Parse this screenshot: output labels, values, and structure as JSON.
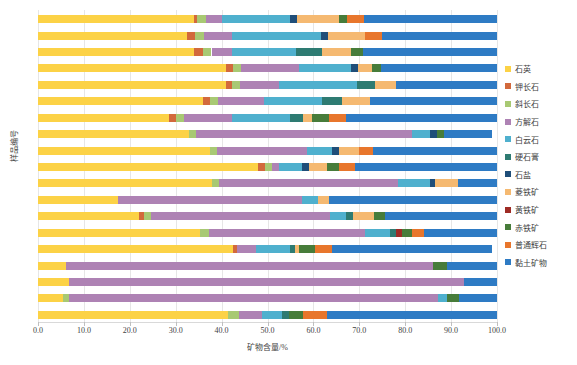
{
  "chart_data": {
    "type": "bar",
    "orientation": "horizontal",
    "stacked": true,
    "title": "",
    "xlabel": "矿物含量/%",
    "ylabel": "样品编号",
    "xlim": [
      0,
      100
    ],
    "xticks": [
      "0.0",
      "10.0",
      "20.0",
      "30.0",
      "40.0",
      "50.0",
      "60.0",
      "70.0",
      "80.0",
      "90.0",
      "100.0"
    ],
    "xtick_values": [
      0,
      10,
      20,
      30,
      40,
      50,
      60,
      70,
      80,
      90,
      100
    ],
    "grid": true,
    "legend_position": "right",
    "categories": [
      "1",
      "2",
      "3",
      "4",
      "5",
      "6",
      "7",
      "8",
      "9",
      "10",
      "11",
      "12",
      "13",
      "14",
      "15",
      "16",
      "17",
      "18",
      "19"
    ],
    "series": [
      {
        "name": "石英",
        "color": "#FCD246",
        "values": [
          41.5,
          5.5,
          6.8,
          6.0,
          42.5,
          35.2,
          22.0,
          17.5,
          38.0,
          48.0,
          37.5,
          33.0,
          28.5,
          36.0,
          41.0,
          41.0,
          34.0,
          32.5,
          34.0
        ]
      },
      {
        "name": "钾长石",
        "color": "#D2693C",
        "values": [
          0.0,
          0.0,
          0.0,
          0.0,
          0.9,
          0.0,
          1.2,
          0.0,
          0.0,
          1.5,
          0.0,
          0.0,
          1.5,
          1.5,
          1.2,
          1.5,
          2.0,
          1.7,
          0.7
        ]
      },
      {
        "name": "斜长石",
        "color": "#A8C973",
        "values": [
          2.2,
          1.2,
          0.0,
          0.0,
          0.0,
          2.0,
          1.5,
          0.0,
          1.5,
          1.5,
          1.5,
          1.5,
          1.8,
          1.8,
          1.8,
          1.8,
          1.8,
          2.0,
          1.8
        ]
      },
      {
        "name": "方解石",
        "color": "#AE82B4",
        "values": [
          5.0,
          80.5,
          86.0,
          80.0,
          4.0,
          34.0,
          39.0,
          40.0,
          39.0,
          1.5,
          19.5,
          47.0,
          10.5,
          10.0,
          8.5,
          12.5,
          4.5,
          6.0,
          3.5
        ]
      },
      {
        "name": "白云石",
        "color": "#4FB0CE",
        "values": [
          4.5,
          2.0,
          0.0,
          0.0,
          7.5,
          5.5,
          3.5,
          3.5,
          7.0,
          5.0,
          5.5,
          4.0,
          12.5,
          12.5,
          17.0,
          11.5,
          14.0,
          19.5,
          15.0
        ]
      },
      {
        "name": "硬石膏",
        "color": "#2E7B72",
        "values": [
          1.5,
          0.0,
          0.0,
          0.0,
          1.0,
          1.2,
          1.5,
          0.0,
          0.0,
          0.0,
          0.0,
          0.0,
          3.0,
          4.5,
          4.0,
          0.0,
          5.5,
          0.0,
          0.0
        ]
      },
      {
        "name": "石盐",
        "color": "#1F4E79",
        "values": [
          0.0,
          0.0,
          0.0,
          0.0,
          0.0,
          0.0,
          0.0,
          0.0,
          1.0,
          1.5,
          1.5,
          1.5,
          0.0,
          0.0,
          0.0,
          1.5,
          0.0,
          1.5,
          1.5
        ]
      },
      {
        "name": "菱铁矿",
        "color": "#F5B971",
        "values": [
          0.0,
          0.0,
          0.0,
          0.0,
          1.0,
          0.0,
          4.5,
          2.5,
          5.0,
          4.0,
          4.5,
          0.0,
          2.0,
          6.0,
          4.5,
          3.0,
          6.5,
          8.0,
          9.0
        ]
      },
      {
        "name": "黄铁矿",
        "color": "#9E2B25",
        "values": [
          0.0,
          0.0,
          0.0,
          0.0,
          0.0,
          1.5,
          0.0,
          0.0,
          0.0,
          0.0,
          0.0,
          0.0,
          0.0,
          0.0,
          0.0,
          0.0,
          0.0,
          0.0,
          0.0
        ]
      },
      {
        "name": "赤铁矿",
        "color": "#477C3A",
        "values": [
          3.0,
          2.5,
          0.0,
          3.0,
          3.5,
          2.0,
          2.5,
          0.0,
          0.0,
          2.5,
          0.0,
          1.5,
          3.5,
          0.0,
          0.0,
          2.0,
          2.5,
          0.0,
          1.8
        ]
      },
      {
        "name": "普通辉石",
        "color": "#E8762C",
        "values": [
          5.3,
          0.0,
          0.0,
          0.0,
          3.6,
          2.6,
          0.0,
          0.0,
          0.0,
          3.5,
          3.0,
          0.0,
          3.7,
          0.0,
          0.0,
          0.0,
          0.0,
          3.8,
          3.7
        ]
      },
      {
        "name": "黏土矿物",
        "color": "#2E7BC4",
        "values": [
          37.0,
          8.3,
          7.2,
          11.0,
          35.0,
          16.0,
          24.3,
          36.5,
          8.5,
          31.0,
          27.0,
          10.5,
          33.0,
          27.7,
          22.0,
          25.2,
          29.2,
          25.0,
          29.0
        ]
      }
    ]
  }
}
